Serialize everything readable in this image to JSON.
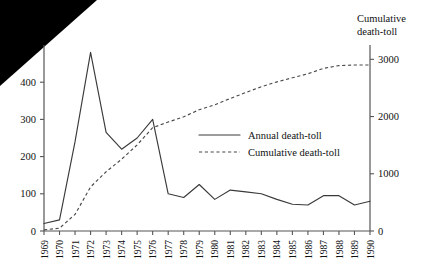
{
  "chart_data": {
    "type": "line",
    "title": "",
    "xlabel": "",
    "ylabel": "",
    "grid": false,
    "legend_position": "center",
    "x": [
      1969,
      1970,
      1971,
      1972,
      1973,
      1974,
      1975,
      1976,
      1977,
      1978,
      1979,
      1980,
      1981,
      1982,
      1983,
      1984,
      1985,
      1986,
      1987,
      1988,
      1989,
      1990
    ],
    "categories": [
      "1969",
      "1970",
      "1971",
      "1972",
      "1973",
      "1974",
      "1975",
      "1976",
      "1977",
      "1978",
      "1979",
      "1980",
      "1981",
      "1982",
      "1983",
      "1984",
      "1985",
      "1986",
      "1987",
      "1988",
      "1989",
      "1990"
    ],
    "left_axis": {
      "label": "",
      "ticks": [
        0,
        100,
        200,
        300,
        400
      ],
      "tick_labels": [
        "0",
        "100",
        "200",
        "300",
        "400"
      ],
      "ylim": [
        0,
        500
      ]
    },
    "right_axis": {
      "label": "Cumulative death-toll",
      "label_line1": "Cumulative",
      "label_line2": "death-toll",
      "ticks": [
        0,
        1000,
        2000,
        3000
      ],
      "tick_labels": [
        "0",
        "1000",
        "2000",
        "3000"
      ],
      "ylim": [
        0,
        3250
      ]
    },
    "series": [
      {
        "name": "Annual death-toll",
        "axis": "left",
        "style": "solid",
        "color": "#3a3a3a",
        "values": [
          20,
          30,
          240,
          480,
          265,
          220,
          250,
          300,
          100,
          90,
          125,
          85,
          110,
          105,
          100,
          85,
          72,
          70,
          95,
          95,
          70,
          80
        ]
      },
      {
        "name": "Cumulative death-toll",
        "axis": "right",
        "style": "dashed",
        "color": "#4a4a4a",
        "values": [
          20,
          50,
          290,
          770,
          1035,
          1255,
          1505,
          1805,
          1905,
          1995,
          2120,
          2205,
          2315,
          2420,
          2520,
          2605,
          2677,
          2747,
          2842,
          2890,
          2900,
          2900
        ]
      }
    ],
    "legend": [
      {
        "label": "Annual death-toll",
        "style": "solid"
      },
      {
        "label": "Cumulative death-toll",
        "style": "dashed"
      }
    ]
  }
}
